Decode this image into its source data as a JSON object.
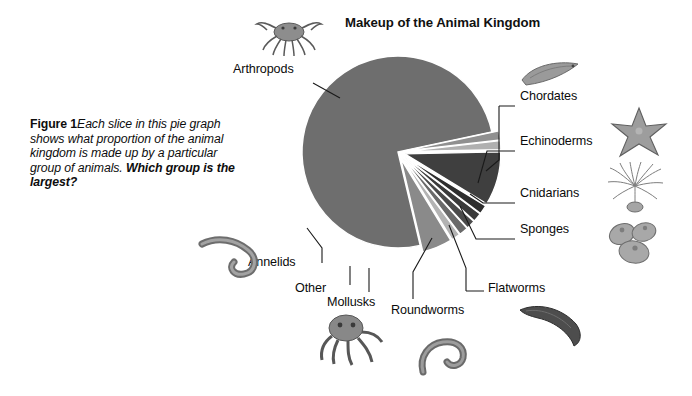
{
  "figure": {
    "label": "Figure 1",
    "caption_part1": "Each slice in this pie graph shows what proportion of the animal kingdom is made up by a particular group of animals. ",
    "caption_question": "Which group is the largest?"
  },
  "chart_data": {
    "type": "pie",
    "title": "Makeup of the Animal Kingdom",
    "xlabel": "",
    "ylabel": "",
    "legend_position": "callout-labels",
    "grid": false,
    "categories": [
      "Arthropods",
      "Chordates",
      "Echinoderms",
      "Cnidarians",
      "Sponges",
      "Flatworms",
      "Roundworms",
      "Mollusks",
      "Other",
      "Annelids"
    ],
    "values": [
      75,
      5,
      1.5,
      1.5,
      1.5,
      1.5,
      1.5,
      9,
      1.5,
      1.5
    ],
    "colors": [
      "#6e6e6e",
      "#8a8a8a",
      "#b3b3b3",
      "#6a6a6a",
      "#4a4a4a",
      "#3a3a3a",
      "#2e2e2e",
      "#3f3f3f",
      "#b0b0b0",
      "#909090"
    ],
    "slices": [
      {
        "name": "Arthropods",
        "value": 75,
        "color": "#6e6e6e",
        "exploded": false
      },
      {
        "name": "Chordates",
        "value": 5,
        "color": "#8a8a8a",
        "exploded": true
      },
      {
        "name": "Echinoderms",
        "value": 1.5,
        "color": "#b3b3b3",
        "exploded": true
      },
      {
        "name": "Cnidarians",
        "value": 1.5,
        "color": "#6a6a6a",
        "exploded": true
      },
      {
        "name": "Sponges",
        "value": 1.5,
        "color": "#4a4a4a",
        "exploded": true
      },
      {
        "name": "Flatworms",
        "value": 1.5,
        "color": "#3a3a3a",
        "exploded": true
      },
      {
        "name": "Roundworms",
        "value": 1.5,
        "color": "#2e2e2e",
        "exploded": true
      },
      {
        "name": "Mollusks",
        "value": 9,
        "color": "#3f3f3f",
        "exploded": true
      },
      {
        "name": "Other",
        "value": 1.5,
        "color": "#b0b0b0",
        "exploded": true
      },
      {
        "name": "Annelids",
        "value": 1.5,
        "color": "#909090",
        "exploded": true
      }
    ]
  },
  "labels": {
    "arthropods": "Arthropods",
    "chordates": "Chordates",
    "echinoderms": "Echinoderms",
    "cnidarians": "Cnidarians",
    "sponges": "Sponges",
    "flatworms": "Flatworms",
    "roundworms": "Roundworms",
    "mollusks": "Mollusks",
    "other": "Other",
    "annelids": "Annelids"
  },
  "illustrations": [
    {
      "name": "crab-illustration",
      "group": "Arthropods"
    },
    {
      "name": "tunicate-illustration",
      "group": "Chordates"
    },
    {
      "name": "starfish-illustration",
      "group": "Echinoderms"
    },
    {
      "name": "sea-anemone-illustration",
      "group": "Cnidarians"
    },
    {
      "name": "sponge-illustration",
      "group": "Sponges"
    },
    {
      "name": "flatworm-illustration",
      "group": "Flatworms"
    },
    {
      "name": "roundworm-illustration",
      "group": "Roundworms"
    },
    {
      "name": "octopus-illustration",
      "group": "Mollusks"
    },
    {
      "name": "earthworm-illustration",
      "group": "Annelids"
    }
  ]
}
